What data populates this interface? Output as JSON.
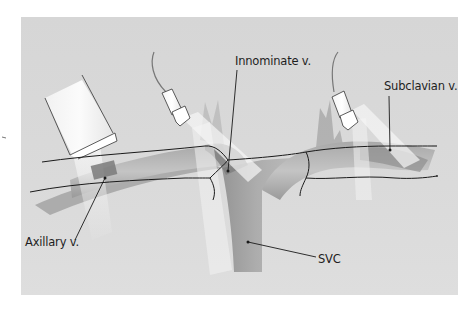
{
  "figure": {
    "colors": {
      "page_background": "#ffffff",
      "panel_background": "#d9d9d9",
      "vessel_dark": "#8a8a8a",
      "vessel_light": "#bdbdbd",
      "beam": "#f2f2f2",
      "outline": "#1a1a1a"
    }
  },
  "labels": {
    "innominate": "Innominate v.",
    "subclavian": "Subclavian v.",
    "axillary": "Axillary v.",
    "svc": "SVC"
  },
  "transducers": [
    {
      "name": "left-transducer",
      "type": "linear-probe"
    },
    {
      "name": "middle-transducer",
      "type": "small-probe-with-cable"
    },
    {
      "name": "right-transducer",
      "type": "small-probe-with-cable"
    }
  ]
}
